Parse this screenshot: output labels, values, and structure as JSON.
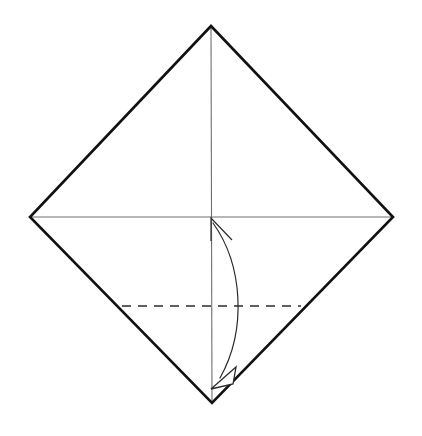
{
  "diagram": {
    "canvas": {
      "width": 422,
      "height": 436,
      "background": "#ffffff"
    },
    "colors": {
      "paper_edge": "#111111",
      "crease_line": "#6e6e6e",
      "dashed_fold": "#2b2b2b",
      "arrow": "#2b2b2b",
      "arrowhead_fill": "#ffffff",
      "background": "#ffffff"
    },
    "shapes": {
      "paper_outline": {
        "name": "square-sheet-diamond",
        "points": "211,26 393,217 212,403 30,217",
        "vertices": {
          "top": {
            "x": 211,
            "y": 26
          },
          "right": {
            "x": 393,
            "y": 217
          },
          "bottom": {
            "x": 212,
            "y": 403
          },
          "left": {
            "x": 30,
            "y": 217
          }
        }
      },
      "vertical_crease": {
        "name": "vertical-center-crease",
        "x1": 211,
        "y1": 26,
        "x2": 212,
        "y2": 403
      },
      "horizontal_crease": {
        "name": "horizontal-center-crease",
        "x1": 30,
        "y1": 217,
        "x2": 393,
        "y2": 217
      },
      "dashed_fold_line": {
        "name": "valley-fold-line",
        "x1": 122,
        "y1": 306,
        "x2": 301,
        "y2": 306
      },
      "fold_arc": {
        "name": "fold-and-unfold-arrow",
        "path": "M 213,223 C 243,265 247,330 220,378",
        "bulge_x": 241,
        "from": {
          "x": 213,
          "y": 223
        },
        "to": {
          "x": 220,
          "y": 378
        }
      },
      "arrowhead_top": {
        "name": "arrow-tip-up",
        "tip": {
          "x": 211,
          "y": 218
        },
        "barb_path": "M 232,240 L 211,218 L 211,241"
      },
      "arrowhead_bottom": {
        "name": "arrow-tip-down-hollow",
        "points": "211,389 236,367 233,384"
      }
    },
    "center_point": {
      "x": 212,
      "y": 217
    }
  }
}
